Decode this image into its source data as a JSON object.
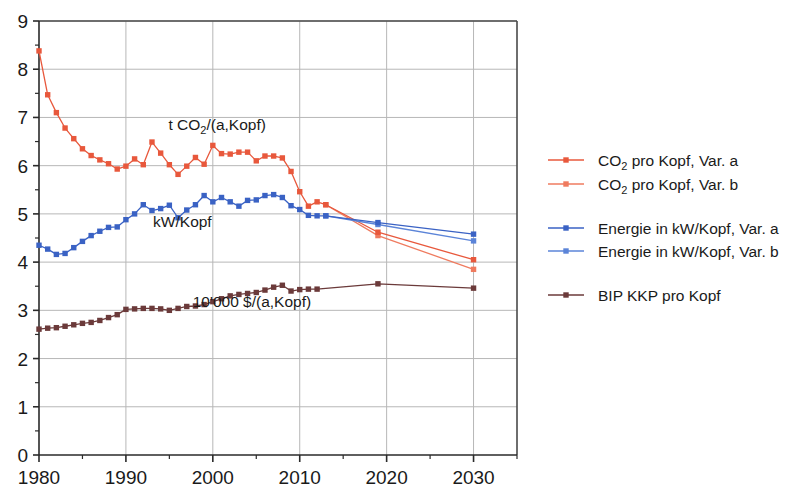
{
  "chart_data": {
    "type": "line",
    "title": "",
    "xlabel": "",
    "ylabel": "",
    "xlim": [
      1980,
      2035
    ],
    "ylim": [
      0,
      9
    ],
    "x_major_ticks": [
      1980,
      1990,
      2000,
      2010,
      2020,
      2030
    ],
    "x_minor_ticks": [
      1985,
      1995,
      2005,
      2015,
      2025,
      2035
    ],
    "y_major_ticks": [
      0,
      1,
      2,
      3,
      4,
      5,
      6,
      7,
      8,
      9
    ],
    "y_minor_step": 0.5,
    "grid": "major x and y gridlines shown, light gray",
    "legend_position": "right",
    "colors": {
      "co2_var_a": "#e8583c",
      "co2_var_b": "#ef7b5f",
      "energie_var_a": "#3a62c4",
      "energie_var_b": "#5b84d8",
      "bip": "#6b3a3a",
      "grid": "#b7b7b7",
      "axis": "#4a4a4a"
    },
    "annotations": [
      {
        "id": "co2-annotation",
        "text": "t CO2/(a,Kopf)",
        "text_main": "t CO",
        "text_sub": "2",
        "text_tail": "/(a,Kopf)",
        "x": 2000.5,
        "y": 6.75
      },
      {
        "id": "energie-annotation",
        "text": "kW/Kopf",
        "x": 1996.5,
        "y": 4.72
      },
      {
        "id": "bip-annotation",
        "text": "10'000 $/(a,Kopf)",
        "x": 2004.5,
        "y": 3.06
      }
    ],
    "series": [
      {
        "name": "CO2 pro Kopf, Var. a",
        "key": "co2_var_a",
        "color": "#e8583c",
        "marker": "square",
        "points": [
          [
            1980,
            8.38
          ],
          [
            1981,
            7.47
          ],
          [
            1982,
            7.1
          ],
          [
            1983,
            6.78
          ],
          [
            1984,
            6.56
          ],
          [
            1985,
            6.35
          ],
          [
            1986,
            6.21
          ],
          [
            1987,
            6.12
          ],
          [
            1988,
            6.04
          ],
          [
            1989,
            5.93
          ],
          [
            1990,
            5.99
          ],
          [
            1991,
            6.14
          ],
          [
            1992,
            6.02
          ],
          [
            1993,
            6.49
          ],
          [
            1994,
            6.26
          ],
          [
            1995,
            6.02
          ],
          [
            1996,
            5.82
          ],
          [
            1997,
            5.99
          ],
          [
            1998,
            6.17
          ],
          [
            1999,
            6.03
          ],
          [
            2000,
            6.42
          ],
          [
            2001,
            6.25
          ],
          [
            2002,
            6.24
          ],
          [
            2003,
            6.28
          ],
          [
            2004,
            6.28
          ],
          [
            2005,
            6.1
          ],
          [
            2006,
            6.2
          ],
          [
            2007,
            6.2
          ],
          [
            2008,
            6.16
          ],
          [
            2009,
            5.88
          ],
          [
            2010,
            5.46
          ],
          [
            2011,
            5.16
          ],
          [
            2012,
            5.25
          ],
          [
            2013,
            5.19
          ],
          [
            2019,
            4.62
          ],
          [
            2030,
            4.05
          ]
        ]
      },
      {
        "name": "CO2 pro Kopf, Var. b",
        "key": "co2_var_b",
        "color": "#ef7b5f",
        "marker": "square",
        "points": [
          [
            2013,
            5.19
          ],
          [
            2019,
            4.55
          ],
          [
            2030,
            3.85
          ]
        ]
      },
      {
        "name": "Energie in kW/Kopf, Var. a",
        "key": "energie_var_a",
        "color": "#3a62c4",
        "marker": "square",
        "points": [
          [
            1980,
            4.35
          ],
          [
            1981,
            4.27
          ],
          [
            1982,
            4.16
          ],
          [
            1983,
            4.18
          ],
          [
            1984,
            4.3
          ],
          [
            1985,
            4.43
          ],
          [
            1986,
            4.55
          ],
          [
            1987,
            4.64
          ],
          [
            1988,
            4.72
          ],
          [
            1989,
            4.73
          ],
          [
            1990,
            4.88
          ],
          [
            1991,
            5.0
          ],
          [
            1992,
            5.19
          ],
          [
            1993,
            5.07
          ],
          [
            1994,
            5.11
          ],
          [
            1995,
            5.18
          ],
          [
            1996,
            4.92
          ],
          [
            1997,
            5.08
          ],
          [
            1998,
            5.19
          ],
          [
            1999,
            5.38
          ],
          [
            2000,
            5.25
          ],
          [
            2001,
            5.34
          ],
          [
            2002,
            5.25
          ],
          [
            2003,
            5.16
          ],
          [
            2004,
            5.28
          ],
          [
            2005,
            5.29
          ],
          [
            2006,
            5.38
          ],
          [
            2007,
            5.4
          ],
          [
            2008,
            5.34
          ],
          [
            2009,
            5.17
          ],
          [
            2010,
            5.09
          ],
          [
            2011,
            4.97
          ],
          [
            2012,
            4.96
          ],
          [
            2013,
            4.96
          ],
          [
            2019,
            4.82
          ],
          [
            2030,
            4.58
          ]
        ]
      },
      {
        "name": "Energie in kW/Kopf, Var. b",
        "key": "energie_var_b",
        "color": "#5b84d8",
        "marker": "square",
        "points": [
          [
            2013,
            4.96
          ],
          [
            2019,
            4.78
          ],
          [
            2030,
            4.44
          ]
        ]
      },
      {
        "name": "BIP KKP pro Kopf",
        "key": "bip",
        "color": "#6b3a3a",
        "marker": "square",
        "points": [
          [
            1980,
            2.61
          ],
          [
            1981,
            2.63
          ],
          [
            1982,
            2.64
          ],
          [
            1983,
            2.67
          ],
          [
            1984,
            2.7
          ],
          [
            1985,
            2.73
          ],
          [
            1986,
            2.75
          ],
          [
            1987,
            2.79
          ],
          [
            1988,
            2.85
          ],
          [
            1989,
            2.91
          ],
          [
            1990,
            3.02
          ],
          [
            1991,
            3.03
          ],
          [
            1992,
            3.04
          ],
          [
            1993,
            3.04
          ],
          [
            1994,
            3.03
          ],
          [
            1995,
            3.0
          ],
          [
            1996,
            3.04
          ],
          [
            1997,
            3.08
          ],
          [
            1998,
            3.09
          ],
          [
            1999,
            3.12
          ],
          [
            2000,
            3.18
          ],
          [
            2001,
            3.24
          ],
          [
            2002,
            3.3
          ],
          [
            2003,
            3.33
          ],
          [
            2004,
            3.35
          ],
          [
            2005,
            3.37
          ],
          [
            2006,
            3.42
          ],
          [
            2007,
            3.48
          ],
          [
            2008,
            3.52
          ],
          [
            2009,
            3.4
          ],
          [
            2010,
            3.43
          ],
          [
            2011,
            3.44
          ],
          [
            2012,
            3.44
          ],
          [
            2019,
            3.55
          ],
          [
            2030,
            3.46
          ]
        ]
      }
    ]
  },
  "axis": {
    "x_tick_labels": [
      "1980",
      "1990",
      "2000",
      "2010",
      "2020",
      "2030"
    ],
    "y_tick_labels": [
      "0",
      "1",
      "2",
      "3",
      "4",
      "5",
      "6",
      "7",
      "8",
      "9"
    ]
  },
  "legend": {
    "items": [
      {
        "id": "legend-co2-var-a",
        "label": "CO2 pro Kopf, Var. a",
        "label_main": "CO",
        "label_sub": "2",
        "label_tail": " pro Kopf, Var. a",
        "color": "#e8583c",
        "series_key": "co2_var_a"
      },
      {
        "id": "legend-co2-var-b",
        "label": "CO2 pro Kopf, Var. b",
        "label_main": "CO",
        "label_sub": "2",
        "label_tail": " pro Kopf, Var. b",
        "color": "#ef7b5f",
        "series_key": "co2_var_b"
      },
      {
        "id": "legend-energie-var-a",
        "label": "Energie in kW/Kopf, Var. a",
        "color": "#3a62c4",
        "series_key": "energie_var_a"
      },
      {
        "id": "legend-energie-var-b",
        "label": "Energie in kW/Kopf, Var. b",
        "color": "#5b84d8",
        "series_key": "energie_var_b"
      },
      {
        "id": "legend-bip",
        "label": "BIP KKP pro Kopf",
        "color": "#6b3a3a",
        "series_key": "bip"
      }
    ]
  }
}
